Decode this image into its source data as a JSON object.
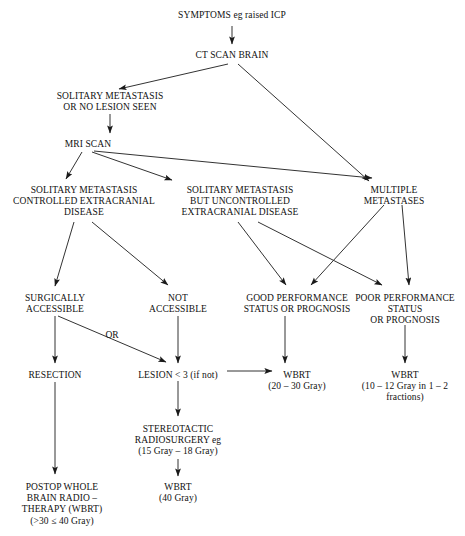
{
  "diagram": {
    "type": "flowchart",
    "background_color": "#ffffff",
    "text_color": "#111111",
    "line_color": "#1a1a1a",
    "nodes": [
      {
        "id": "symptoms",
        "text": "SYMPTOMS eg raised ICP",
        "x": 232,
        "y": 10
      },
      {
        "id": "ct_scan",
        "text": "CT SCAN BRAIN",
        "x": 232,
        "y": 50
      },
      {
        "id": "solitary_none",
        "text": "SOLITARY METASTASIS\nOR NO LESION SEEN",
        "x": 110,
        "y": 91
      },
      {
        "id": "mri_scan",
        "text": "MRI SCAN",
        "x": 88,
        "y": 139
      },
      {
        "id": "controlled",
        "text": "SOLITARY METASTASIS\nCONTROLLED EXTRACRANIAL\nDISEASE",
        "x": 84,
        "y": 185
      },
      {
        "id": "uncontrolled",
        "text": "SOLITARY METASTASIS\nBUT UNCONTROLLED\nEXTRACRANIAL DISEASE",
        "x": 240,
        "y": 185
      },
      {
        "id": "multiple",
        "text": "MULTIPLE\nMETASTASES",
        "x": 394,
        "y": 185
      },
      {
        "id": "surgically",
        "text": "SURGICALLY\nACCESSIBLE",
        "x": 55,
        "y": 293
      },
      {
        "id": "not_accessible",
        "text": "NOT\nACCESSIBLE",
        "x": 178,
        "y": 293
      },
      {
        "id": "good_perf",
        "text": "GOOD PERFORMANCE\nSTATUS OR PROGNOSIS",
        "x": 297,
        "y": 293
      },
      {
        "id": "poor_perf",
        "text": "POOR PERFORMANCE\nSTATUS\nOR PROGNOSIS",
        "x": 405,
        "y": 293
      },
      {
        "id": "resection",
        "text": "RESECTION",
        "x": 55,
        "y": 370
      },
      {
        "id": "lesion_lt3",
        "text": "LESION < 3 (if not)",
        "x": 178,
        "y": 370
      },
      {
        "id": "wbrt_2030",
        "text": "WBRT\n(20 – 30 Gray)",
        "x": 297,
        "y": 370
      },
      {
        "id": "wbrt_1012",
        "text": "WBRT\n(10 – 12 Gray in 1 – 2\nfractions)",
        "x": 405,
        "y": 370
      },
      {
        "id": "srs",
        "text": "STEREOTACTIC\nRADIOSURGERY eg\n(15 Gray – 18 Gray)",
        "x": 178,
        "y": 424
      },
      {
        "id": "wbrt_40",
        "text": "WBRT\n(40 Gray)",
        "x": 178,
        "y": 482
      },
      {
        "id": "postop",
        "text": "POSTOP WHOLE\nBRAIN RADIO –\nTHERAPY (WBRT)\n(>30 ≤ 40 Gray)",
        "x": 62,
        "y": 482
      }
    ],
    "edge_labels": [
      {
        "id": "or_label",
        "text": "OR",
        "x": 112,
        "y": 330
      }
    ],
    "edges": [
      {
        "from": "symptoms",
        "to": "ct_scan",
        "kind": "straight-down"
      },
      {
        "from": "ct_scan",
        "to": "solitary_none",
        "kind": "diagonal-left"
      },
      {
        "from": "ct_scan",
        "to": "multiple",
        "kind": "diagonal-right"
      },
      {
        "from": "solitary_none",
        "to": "mri_scan",
        "kind": "straight-down"
      },
      {
        "from": "mri_scan",
        "to": "controlled",
        "kind": "diagonal"
      },
      {
        "from": "mri_scan",
        "to": "uncontrolled",
        "kind": "diagonal"
      },
      {
        "from": "mri_scan",
        "to": "multiple",
        "kind": "diagonal"
      },
      {
        "from": "controlled",
        "to": "surgically",
        "kind": "diagonal"
      },
      {
        "from": "controlled",
        "to": "not_accessible",
        "kind": "diagonal"
      },
      {
        "from": "uncontrolled",
        "to": "good_perf",
        "kind": "diagonal"
      },
      {
        "from": "uncontrolled",
        "to": "poor_perf",
        "kind": "diagonal-cross"
      },
      {
        "from": "multiple",
        "to": "good_perf",
        "kind": "diagonal-cross"
      },
      {
        "from": "multiple",
        "to": "poor_perf",
        "kind": "diagonal"
      },
      {
        "from": "surgically",
        "to": "resection",
        "kind": "straight-down"
      },
      {
        "from": "surgically",
        "to": "lesion_lt3",
        "kind": "diagonal-or"
      },
      {
        "from": "not_accessible",
        "to": "lesion_lt3",
        "kind": "straight-down"
      },
      {
        "from": "good_perf",
        "to": "wbrt_2030",
        "kind": "straight-down"
      },
      {
        "from": "poor_perf",
        "to": "wbrt_1012",
        "kind": "straight-down"
      },
      {
        "from": "lesion_lt3",
        "to": "wbrt_2030",
        "kind": "horizontal-right"
      },
      {
        "from": "lesion_lt3",
        "to": "srs",
        "kind": "straight-down"
      },
      {
        "from": "srs",
        "to": "wbrt_40",
        "kind": "straight-down"
      },
      {
        "from": "resection",
        "to": "postop",
        "kind": "straight-down"
      }
    ]
  }
}
